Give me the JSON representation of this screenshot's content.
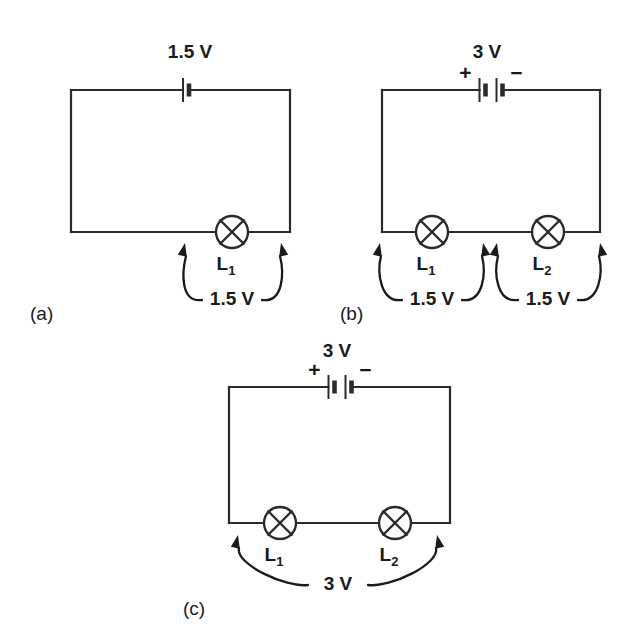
{
  "figure": {
    "title_visible": false,
    "background_color": "#ffffff",
    "ink_color": "#2b2b2b",
    "panels": [
      {
        "id": "a",
        "label": "(a)",
        "label_pos": {
          "x": 30,
          "y": 320
        },
        "rect": {
          "x": 71,
          "y": 90,
          "w": 219,
          "h": 142
        },
        "source": {
          "kind": "cell",
          "cells": 1,
          "voltage_label": "1.5 V",
          "voltage_label_pos": {
            "x": 190,
            "y": 58
          },
          "polarity_visible": false,
          "plus_label": "+",
          "minus_label": "−",
          "center_x": 186
        },
        "lamps": [
          {
            "name": "L",
            "subscript": "1",
            "label": "L₁",
            "cx": 232,
            "cy": 232,
            "r": 16
          }
        ],
        "measurements": [
          {
            "value_label": "1.5 V",
            "value_pos": {
              "x": 232,
              "y": 305
            },
            "arrow_left_tip": {
              "x": 185,
              "y": 243
            },
            "arrow_right_tip": {
              "x": 281,
              "y": 243
            }
          }
        ]
      },
      {
        "id": "b",
        "label": "(b)",
        "label_pos": {
          "x": 340,
          "y": 320
        },
        "rect": {
          "x": 382,
          "y": 90,
          "w": 218,
          "h": 142
        },
        "source": {
          "kind": "battery",
          "cells": 2,
          "voltage_label": "3 V",
          "voltage_label_pos": {
            "x": 487,
            "y": 58
          },
          "polarity_visible": true,
          "plus_label": "+",
          "minus_label": "−",
          "center_x": 491
        },
        "lamps": [
          {
            "name": "L",
            "subscript": "1",
            "label": "L₁",
            "cx": 432,
            "cy": 232,
            "r": 16
          },
          {
            "name": "L",
            "subscript": "2",
            "label": "L₂",
            "cx": 548,
            "cy": 232,
            "r": 16
          }
        ],
        "measurements": [
          {
            "value_label": "1.5 V",
            "value_pos": {
              "x": 432,
              "y": 305
            },
            "arrow_left_tip": {
              "x": 380,
              "y": 243
            },
            "arrow_right_tip": {
              "x": 483,
              "y": 243
            }
          },
          {
            "value_label": "1.5 V",
            "value_pos": {
              "x": 548,
              "y": 305
            },
            "arrow_left_tip": {
              "x": 497,
              "y": 243
            },
            "arrow_right_tip": {
              "x": 600,
              "y": 243
            }
          }
        ]
      },
      {
        "id": "c",
        "label": "(c)",
        "label_pos": {
          "x": 183,
          "y": 615
        },
        "rect": {
          "x": 229,
          "y": 387,
          "w": 221,
          "h": 136
        },
        "source": {
          "kind": "battery",
          "cells": 2,
          "voltage_label": "3 V",
          "voltage_label_pos": {
            "x": 337,
            "y": 357
          },
          "polarity_visible": true,
          "plus_label": "+",
          "minus_label": "−",
          "center_x": 340
        },
        "lamps": [
          {
            "name": "L",
            "subscript": "1",
            "label": "L₁",
            "cx": 280,
            "cy": 523,
            "r": 16
          },
          {
            "name": "L",
            "subscript": "2",
            "label": "L₂",
            "cx": 395,
            "cy": 523,
            "r": 16
          }
        ],
        "measurements": [
          {
            "value_label": "3 V",
            "value_pos": {
              "x": 338,
              "y": 590
            },
            "arrow_left_tip": {
              "x": 238,
              "y": 535
            },
            "arrow_right_tip": {
              "x": 437,
              "y": 535
            }
          }
        ]
      }
    ]
  },
  "icons": {
    "lamp": "lamp-icon",
    "cell": "battery-cell-icon",
    "arrow": "curved-arrow-icon"
  }
}
